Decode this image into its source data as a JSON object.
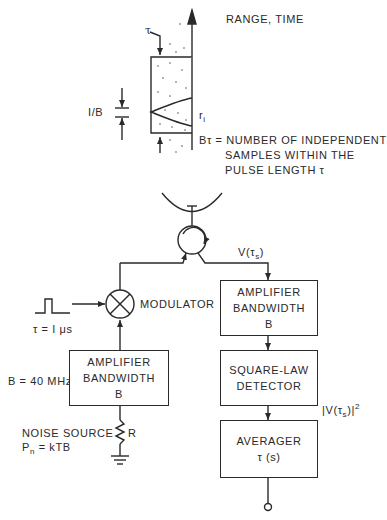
{
  "diagram": {
    "title_axis": "RANGE, TIME",
    "tau_marker": "τ",
    "bandwidth_marker": "I/B",
    "range_cell": "r",
    "range_cell_sub": "i",
    "btau_label": "Bτ = NUMBER OF INDEPENDENT",
    "btau_line2": "SAMPLES WITHIN THE",
    "btau_line3": "PULSE LENGTH τ",
    "signal_v": "V(τ",
    "signal_v_sub": "s",
    "signal_v_close": ")",
    "signal_sq": "|V(τ",
    "signal_sq_sub": "s",
    "signal_sq_close": ")|",
    "signal_sq_sup": "2",
    "modulator_label": "MODULATOR",
    "pulse_label": "τ = I μs",
    "bandwidth_value": "B = 40 MHz",
    "noise_source_label": "NOISE SOURCE",
    "noise_power_label": "P",
    "noise_power_sub": "n",
    "noise_power_eq": " = kTB",
    "resistor_label": "R",
    "blocks": {
      "left_amp": {
        "line1": "AMPLIFIER",
        "line2": "BANDWIDTH",
        "line3": "B"
      },
      "right_amp": {
        "line1": "AMPLIFIER",
        "line2": "BANDWIDTH",
        "line3": "B"
      },
      "detector": {
        "line1": "SQUARE-LAW",
        "line2": "DETECTOR"
      },
      "averager": {
        "line1": "AVERAGER",
        "line2": "τ (s)"
      }
    }
  }
}
